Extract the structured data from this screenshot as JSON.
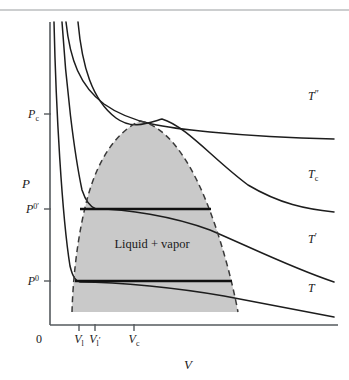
{
  "figure": {
    "title_region_label": "pressure-volume phase diagram",
    "region_label": "Liquid + vapor",
    "background_color": "#ffffff",
    "dome_fill_color": "#c9c9c9",
    "curve_color": "#1d1d1d",
    "axis_color": "#555a5e"
  },
  "axes": {
    "y_axis_label": "P",
    "x_axis_label": "V",
    "origin_label": "0",
    "y_ticks": [
      {
        "key": "Pc",
        "base": "P",
        "sup": "",
        "sub": "c",
        "y": 114
      },
      {
        "key": "P0p",
        "base": "P",
        "sup": "0′",
        "sub": "",
        "y": 209
      },
      {
        "key": "P0",
        "base": "P",
        "sup": "0",
        "sub": "",
        "y": 281
      }
    ],
    "x_ticks": [
      {
        "key": "Vl",
        "base": "V",
        "sub": "l",
        "prime": "",
        "x": 79
      },
      {
        "key": "Vlp",
        "base": "V",
        "sub": "l",
        "prime": "′",
        "x": 95
      },
      {
        "key": "Vc",
        "base": "V",
        "sub": "c",
        "prime": "",
        "x": 134
      }
    ]
  },
  "isotherms": [
    {
      "key": "T2prime",
      "base": "T",
      "prime": "″",
      "sub": "",
      "label_x": 308,
      "label_y": 100,
      "path": "M 66 22 C 70 60, 80 86, 104 104 C 132 124, 168 128, 210 132 C 252 136, 290 138, 334 139"
    },
    {
      "key": "Tc",
      "base": "T",
      "prime": "",
      "sub": "c",
      "label_x": 308,
      "label_y": 178,
      "path": "M 78 22 C 82 66, 92 100, 116 118 C 132 130, 148 123, 162 119 C 186 126, 214 160, 248 185 C 280 204, 306 209, 334 212"
    },
    {
      "key": "Tprime",
      "base": "T",
      "prime": "′",
      "sub": "",
      "label_x": 308,
      "label_y": 243,
      "path": "M 62 22 C 66 86, 74 152, 82 190 C 86 202, 90 207, 96 209 C 126 209, 172 216, 210 230 C 252 248, 292 268, 334 282"
    },
    {
      "key": "T",
      "base": "T",
      "prime": "",
      "sub": "",
      "label_x": 308,
      "label_y": 292,
      "path": "M 54 22 C 56 110, 62 216, 70 266 C 73 278, 76 281, 80 282 C 120 282, 178 288, 224 296 C 270 305, 306 312, 334 317"
    }
  ],
  "dome": {
    "description": "coexistence curve, dashed",
    "left_path": "M 72 312 C 73 276, 78 232, 88 196 C 98 160, 116 132, 140 121",
    "right_path": "M 140 121 C 166 126, 188 158, 204 196 C 220 234, 232 280, 238 312",
    "bottom_y": 312,
    "apex_x": 140,
    "apex_y": 121
  },
  "tielines": [
    {
      "key": "tie-P0prime",
      "x1": 80,
      "x2": 211,
      "y": 209
    },
    {
      "key": "tie-P0",
      "x1": 75,
      "x2": 232,
      "y": 281
    }
  ],
  "geometry": {
    "plot_left": 50,
    "plot_right": 338,
    "plot_top": 22,
    "plot_bottom": 325,
    "top_rule_y": 10
  }
}
